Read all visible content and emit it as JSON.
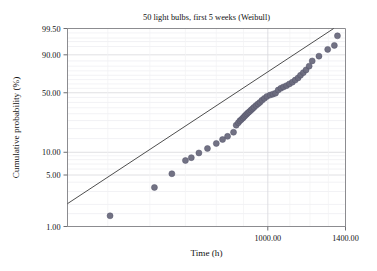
{
  "chart_data": {
    "type": "scatter",
    "title": "50 light bulbs, first 5 weeks (Weibull)",
    "xlabel": "Time (h)",
    "ylabel": "Cumulative probability (%)",
    "xscale": "log",
    "yscale": "weibull-probability",
    "xlim": [
      420,
      1400
    ],
    "ylim": [
      1.0,
      99.5
    ],
    "grid": true,
    "grid_color": "#d8d8dc",
    "xticks": [
      1000.0,
      1400.0
    ],
    "xtick_labels": [
      "1000.00",
      "1400.00"
    ],
    "yticks": [
      1.0,
      5.0,
      10.0,
      50.0,
      90.0,
      99.5
    ],
    "ytick_labels": [
      "1.00",
      "5.00",
      "10.00",
      "50.00",
      "90.00",
      "99.50"
    ],
    "point_color": "#6a6a7d",
    "point_size": 3.0,
    "line_color": "#3a3a3a",
    "series": [
      {
        "name": "failure times",
        "x": [
          505,
          612,
          660,
          700,
          718,
          742,
          770,
          800,
          822,
          840,
          862,
          872,
          880,
          886,
          892,
          898,
          903,
          908,
          913,
          918,
          924,
          930,
          936,
          942,
          950,
          958,
          966,
          975,
          985,
          996,
          1010,
          1022,
          1034,
          1046,
          1058,
          1070,
          1084,
          1098,
          1112,
          1126,
          1140,
          1152,
          1166,
          1180,
          1196,
          1212,
          1248,
          1296,
          1334,
          1352
        ],
        "y": [
          1.4,
          3.4,
          5.2,
          7.8,
          8.5,
          9.8,
          11.2,
          13.0,
          14.6,
          16.0,
          18.0,
          22.0,
          23.5,
          24.8,
          25.8,
          26.8,
          27.8,
          28.8,
          29.8,
          30.8,
          31.8,
          33.0,
          34.2,
          35.4,
          37.0,
          38.5,
          40.0,
          42.0,
          44.0,
          46.0,
          47.5,
          48.5,
          49.5,
          53.0,
          55.0,
          56.5,
          58.0,
          60.0,
          62.0,
          64.5,
          67.0,
          70.0,
          73.0,
          76.0,
          80.0,
          85.0,
          89.0,
          93.5,
          95.5,
          98.5
        ],
        "fit_line": {
          "x1": 420,
          "y1": 2.05,
          "x2": 1330,
          "y2": 99.5
        }
      }
    ]
  }
}
